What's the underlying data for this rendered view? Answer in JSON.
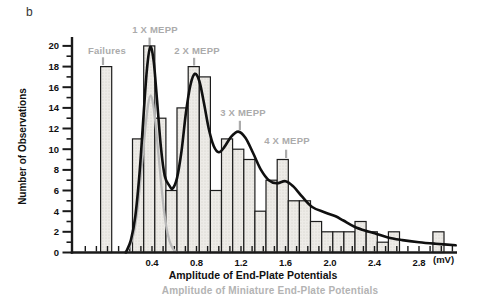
{
  "panel_label": "b",
  "labels": {
    "failures": "Failures",
    "mepp1": "1 X MEPP",
    "mepp2": "2 X MEPP",
    "mepp3": "3 X MEPP",
    "mepp4": "4 X MEPP"
  },
  "chart_data": {
    "type": "bar",
    "title": "",
    "xlabel": "Amplitude of End-Plate Potentials",
    "x_unit_label": "(mV)",
    "secondary_xlabel": "Amplitude of Miniature End-Plate Potentials",
    "ylabel": "Number of Observations",
    "xlim": [
      -0.32,
      3.15
    ],
    "ylim": [
      0,
      20
    ],
    "x_major_ticks": [
      0.4,
      0.8,
      1.2,
      1.6,
      2.0,
      2.4,
      2.8
    ],
    "x_minor_tick_step": 0.1,
    "x_minor_tick_range": [
      -0.2,
      3.1
    ],
    "y_major_ticks": [
      0,
      2,
      4,
      6,
      8,
      10,
      12,
      14,
      16,
      18,
      20
    ],
    "y_minor_tick_step": 1,
    "grid": false,
    "legend": false,
    "bin_width_mV": 0.1,
    "bars": [
      {
        "x_left": -0.062,
        "height": 18,
        "label": "Failures"
      },
      {
        "x_left": 0.225,
        "height": 11
      },
      {
        "x_left": 0.325,
        "height": 20
      },
      {
        "x_left": 0.425,
        "height": 13
      },
      {
        "x_left": 0.525,
        "height": 6
      },
      {
        "x_left": 0.625,
        "height": 14
      },
      {
        "x_left": 0.725,
        "height": 18
      },
      {
        "x_left": 0.825,
        "height": 17
      },
      {
        "x_left": 0.925,
        "height": 6
      },
      {
        "x_left": 1.025,
        "height": 11
      },
      {
        "x_left": 1.125,
        "height": 10
      },
      {
        "x_left": 1.225,
        "height": 9
      },
      {
        "x_left": 1.325,
        "height": 4
      },
      {
        "x_left": 1.425,
        "height": 7
      },
      {
        "x_left": 1.525,
        "height": 9
      },
      {
        "x_left": 1.625,
        "height": 5
      },
      {
        "x_left": 1.725,
        "height": 5
      },
      {
        "x_left": 1.825,
        "height": 3
      },
      {
        "x_left": 1.925,
        "height": 2
      },
      {
        "x_left": 2.025,
        "height": 2
      },
      {
        "x_left": 2.125,
        "height": 2
      },
      {
        "x_left": 2.225,
        "height": 3
      },
      {
        "x_left": 2.325,
        "height": 2
      },
      {
        "x_left": 2.425,
        "height": 1
      },
      {
        "x_left": 2.525,
        "height": 2
      },
      {
        "x_left": 2.925,
        "height": 2
      }
    ],
    "curves": [
      {
        "name": "mepp_gaussian",
        "color": "#b9b9b9",
        "width": 2.3,
        "points": [
          [
            0.155,
            0
          ],
          [
            0.195,
            0.5
          ],
          [
            0.235,
            1.8
          ],
          [
            0.27,
            4.2
          ],
          [
            0.305,
            8.0
          ],
          [
            0.34,
            12.0
          ],
          [
            0.365,
            14.3
          ],
          [
            0.388,
            15.2
          ],
          [
            0.411,
            14.3
          ],
          [
            0.436,
            12.0
          ],
          [
            0.471,
            8.0
          ],
          [
            0.506,
            4.2
          ],
          [
            0.541,
            1.8
          ],
          [
            0.58,
            0.5
          ],
          [
            0.622,
            0
          ]
        ]
      },
      {
        "name": "theoretical_sum",
        "color": "#101010",
        "width": 2.6,
        "points": [
          [
            0.165,
            0
          ],
          [
            0.21,
            1.2
          ],
          [
            0.25,
            3.5
          ],
          [
            0.29,
            8.0
          ],
          [
            0.325,
            13.5
          ],
          [
            0.355,
            17.8
          ],
          [
            0.385,
            19.9
          ],
          [
            0.415,
            18.5
          ],
          [
            0.445,
            14.8
          ],
          [
            0.48,
            10.2
          ],
          [
            0.515,
            7.4
          ],
          [
            0.555,
            6.5
          ],
          [
            0.585,
            6.2
          ],
          [
            0.625,
            7.2
          ],
          [
            0.665,
            9.8
          ],
          [
            0.705,
            13.5
          ],
          [
            0.745,
            16.2
          ],
          [
            0.785,
            17.3
          ],
          [
            0.825,
            16.6
          ],
          [
            0.865,
            14.6
          ],
          [
            0.91,
            12.0
          ],
          [
            0.955,
            10.3
          ],
          [
            1.0,
            9.7
          ],
          [
            1.05,
            10.2
          ],
          [
            1.11,
            11.2
          ],
          [
            1.175,
            11.7
          ],
          [
            1.24,
            11.1
          ],
          [
            1.31,
            9.6
          ],
          [
            1.38,
            8.0
          ],
          [
            1.45,
            7.0
          ],
          [
            1.52,
            6.7
          ],
          [
            1.6,
            6.9
          ],
          [
            1.67,
            6.4
          ],
          [
            1.75,
            5.4
          ],
          [
            1.84,
            4.4
          ],
          [
            1.95,
            3.9
          ],
          [
            2.05,
            3.5
          ],
          [
            2.12,
            3.1
          ],
          [
            2.22,
            2.5
          ],
          [
            2.32,
            2.1
          ],
          [
            2.42,
            1.8
          ],
          [
            2.52,
            1.45
          ],
          [
            2.65,
            1.2
          ],
          [
            2.8,
            1.0
          ],
          [
            2.95,
            0.85
          ],
          [
            3.13,
            0.7
          ]
        ]
      }
    ],
    "annotations": [
      {
        "text": "Failures",
        "x": -0.04,
        "y1": 18.9,
        "y2": 18.15
      },
      {
        "text": "1 X MEPP",
        "x": 0.378,
        "y1": 20.8,
        "y2": 20.1
      },
      {
        "text": "2 X MEPP",
        "x": 0.778,
        "y1": 18.85,
        "y2": 18.1
      },
      {
        "text": "3 X MEPP",
        "x": 1.19,
        "y1": 12.75,
        "y2": 11.85
      },
      {
        "text": "4 X MEPP",
        "x": 1.605,
        "y1": 9.95,
        "y2": 9.15
      }
    ],
    "colors": {
      "bar_fill": "#edebe7",
      "bar_stipple": "#cfccc5",
      "bar_stroke": "#1c1c1c",
      "axis": "#1a1a1a",
      "tick_text": "#111111",
      "gray_label": "#ababab",
      "black_curve": "#101010",
      "gray_curve": "#b9b9b9"
    }
  }
}
